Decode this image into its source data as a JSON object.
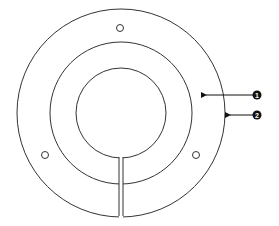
{
  "diagram": {
    "type": "split ring flange / escutcheon plate",
    "colors": {
      "stroke": "#333333",
      "background": "#ffffff",
      "callout_fill": "#111111"
    },
    "callouts": [
      {
        "label": "1",
        "target": "ring face (between middle and outer circle)"
      },
      {
        "label": "2",
        "target": "outer edge"
      }
    ]
  }
}
